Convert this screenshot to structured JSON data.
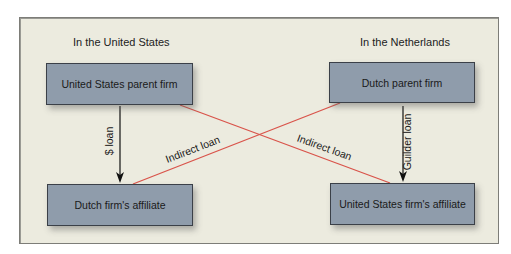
{
  "diagram": {
    "regions": {
      "left": "In the United States",
      "right": "In the Netherlands"
    },
    "boxes": {
      "us_parent": "United States parent firm",
      "dutch_parent": "Dutch parent firm",
      "dutch_affiliate": "Dutch firm's affiliate",
      "us_affiliate": "United States firm's affiliate"
    },
    "arrows": {
      "left_vertical": "$ loan",
      "right_vertical": "Guilder loan",
      "cross_left": "Indirect loan",
      "cross_right": "Indirect loan"
    },
    "colors": {
      "background": "#ecebdf",
      "box_fill": "#8f9cab",
      "cross_line": "#d9534a",
      "arrow": "#111111"
    }
  }
}
